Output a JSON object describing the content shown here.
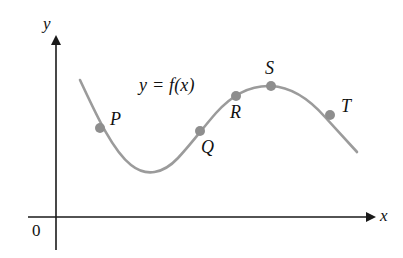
{
  "figure": {
    "kind": "function-graph",
    "background_color": "#ffffff",
    "width": 403,
    "height": 258,
    "equation_label": "y = f(x)",
    "origin_label": "0"
  },
  "axes": {
    "x": {
      "label": "x",
      "color": "#1a1a1a",
      "line": {
        "x1": 28,
        "y1": 217,
        "x2": 368,
        "y2": 217
      },
      "arrow_at": "right",
      "label_pos": {
        "x": 380,
        "y": 207
      }
    },
    "y": {
      "label": "y",
      "color": "#1a1a1a",
      "line": {
        "x1": 56,
        "y1": 250,
        "x2": 56,
        "y2": 43
      },
      "arrow_at": "top",
      "label_pos": {
        "x": 43,
        "y": 15
      }
    },
    "origin_label_pos": {
      "x": 32,
      "y": 222
    }
  },
  "equation_pos": {
    "x": 139,
    "y": 76
  },
  "curve": {
    "color": "#9b9b9b",
    "stroke_width": 2.6,
    "path": "M 80,80 C 95,112 112,150 131,165 C 146,177 163,174 178,158 C 192,143 202,129 216,113 C 232,95 250,85 271,86 C 292,87 310,100 325,117 C 337,130 348,142 357,152"
  },
  "points": [
    {
      "id": "P",
      "label": "P",
      "cx": 100,
      "cy": 128,
      "r": 5.0,
      "color": "#8e8e8e",
      "label_pos": {
        "x": 110,
        "y": 110
      }
    },
    {
      "id": "Q",
      "label": "Q",
      "cx": 200,
      "cy": 131,
      "r": 5.0,
      "color": "#8e8e8e",
      "label_pos": {
        "x": 201,
        "y": 138
      }
    },
    {
      "id": "R",
      "label": "R",
      "cx": 236,
      "cy": 96,
      "r": 5.0,
      "color": "#8e8e8e",
      "label_pos": {
        "x": 230,
        "y": 103
      }
    },
    {
      "id": "S",
      "label": "S",
      "cx": 271,
      "cy": 86,
      "r": 5.0,
      "color": "#8e8e8e",
      "label_pos": {
        "x": 265,
        "y": 59
      }
    },
    {
      "id": "T",
      "label": "T",
      "cx": 330,
      "cy": 115,
      "r": 5.0,
      "color": "#8e8e8e",
      "label_pos": {
        "x": 341,
        "y": 97
      }
    }
  ],
  "chart_data": {
    "type": "line",
    "title": "",
    "subtitle": "",
    "xlabel": "x",
    "ylabel": "y",
    "grid": false,
    "legend": null,
    "annotations": [
      {
        "text": "y = f(x)",
        "x": 139,
        "y": 76
      },
      {
        "text": "0",
        "x": 32,
        "y": 222
      }
    ],
    "series": [
      {
        "name": "y = f(x)",
        "color": "#9b9b9b",
        "x": [
          80,
          100,
          131,
          145,
          178,
          200,
          216,
          236,
          253,
          271,
          295,
          310,
          330,
          345,
          357
        ],
        "y": [
          80,
          128,
          165,
          172,
          158,
          131,
          113,
          96,
          89,
          86,
          89,
          100,
          115,
          132,
          152
        ]
      }
    ],
    "marked_points": [
      {
        "label": "P",
        "x": 100,
        "y": 128
      },
      {
        "label": "Q",
        "x": 200,
        "y": 131
      },
      {
        "label": "R",
        "x": 236,
        "y": 96
      },
      {
        "label": "S",
        "x": 271,
        "y": 86
      },
      {
        "label": "T",
        "x": 330,
        "y": 115
      }
    ]
  }
}
